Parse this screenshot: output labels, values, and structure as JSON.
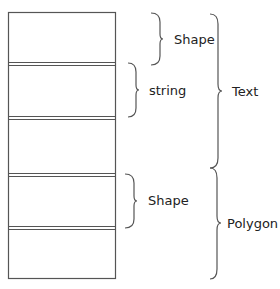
{
  "diagram": {
    "type": "memory-layout",
    "stack_box": {
      "cells": 5
    },
    "labels": {
      "shape_top": "Shape",
      "string": "string",
      "text": "Text",
      "shape_bottom": "Shape",
      "polygon": "Polygon"
    },
    "colors": {
      "line": "#555555",
      "text": "#222222",
      "background": "#ffffff"
    }
  }
}
